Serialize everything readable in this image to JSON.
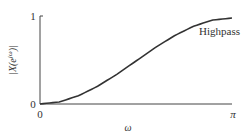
{
  "chart_data": {
    "type": "line",
    "title": "",
    "xlabel": "ω",
    "ylabel": "|X(e^{jω})|",
    "x_tick_labels": [
      "0",
      "π"
    ],
    "y_tick_labels": [
      "0",
      "1"
    ],
    "xlim": [
      0,
      3.1416
    ],
    "ylim": [
      0,
      1
    ],
    "grid": false,
    "annotation": "Highpass",
    "series": [
      {
        "name": "Highpass",
        "x": [
          0,
          0.314,
          0.628,
          0.942,
          1.257,
          1.571,
          1.885,
          2.199,
          2.513,
          2.827,
          3.1416
        ],
        "values": [
          0,
          0.024,
          0.095,
          0.206,
          0.345,
          0.5,
          0.655,
          0.794,
          0.905,
          0.976,
          1.0
        ]
      }
    ]
  },
  "labels": {
    "y_top": "1",
    "y_zero": "0",
    "x_zero": "0",
    "x_pi": "π",
    "x_axis": "ω",
    "y_axis": "|X(e",
    "y_axis_sup": "jω",
    "y_axis_end": ")|",
    "curve_label": "Highpass"
  }
}
